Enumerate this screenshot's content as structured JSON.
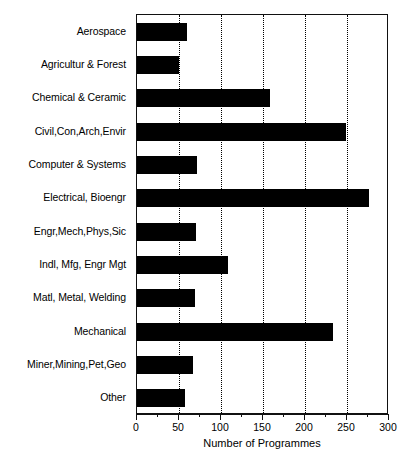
{
  "chart_data": {
    "type": "bar",
    "orientation": "horizontal",
    "title": "",
    "xlabel": "Number of Programmes",
    "ylabel": "",
    "xlim": [
      0,
      300
    ],
    "xticks": [
      0,
      50,
      100,
      150,
      200,
      250,
      300
    ],
    "xtick_labels": [
      "0",
      "50",
      "100",
      "150",
      "200",
      "250",
      "300"
    ],
    "minor_tick_interval": 25,
    "grid": "vertical-dotted",
    "legend": "none",
    "bar_color": "#000000",
    "categories": [
      "Aerospace",
      "Agricultur & Forest",
      "Chemical & Ceramic",
      "Civil,Con,Arch,Envir",
      "Computer & Systems",
      "Electrical, Bioengr",
      "Engr,Mech,Phys,Sic",
      "Indl, Mfg, Engr Mgt",
      "Matl, Metal, Welding",
      "Mechanical",
      "Miner,Mining,Pet,Geo",
      "Other"
    ],
    "values": [
      60,
      50,
      158,
      249,
      71,
      276,
      70,
      108,
      69,
      233,
      67,
      57
    ]
  }
}
